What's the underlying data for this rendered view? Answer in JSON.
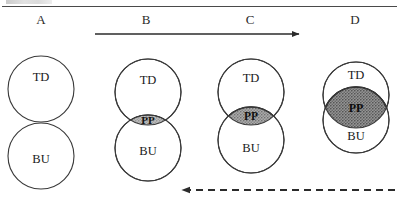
{
  "figure": {
    "panel_labels": [
      {
        "id": "A",
        "text": "A",
        "x": 41
      },
      {
        "id": "B",
        "text": "B",
        "x": 146
      },
      {
        "id": "C",
        "text": "C",
        "x": 250
      },
      {
        "id": "D",
        "text": "D",
        "x": 355
      }
    ],
    "top_arrow": {
      "name": "forward-progression-arrow",
      "style": "solid",
      "direction": "right",
      "x_start": 95,
      "x_end": 300,
      "y": 34
    },
    "bottom_arrow": {
      "name": "reverse-progression-arrow",
      "style": "dashed",
      "direction": "left",
      "x_start": 395,
      "x_end": 180,
      "y": 190
    },
    "circle_labels": {
      "top": "TD",
      "bottom": "BU",
      "overlap": "PP"
    },
    "panels": [
      {
        "id": "A",
        "cx": 41,
        "td_cy": 89,
        "bu_cy": 156,
        "r": 33,
        "td_label": "TD",
        "bu_label": "BU",
        "pp_label": "",
        "has_overlap": false,
        "overlap_fill": "",
        "td_label_y": 76,
        "bu_label_y": 163
      },
      {
        "id": "B",
        "cx": 148,
        "td_cy": 92,
        "bu_cy": 148,
        "r": 33,
        "td_label": "TD",
        "bu_label": "BU",
        "pp_label": "PP",
        "has_overlap": true,
        "overlap_fill": "#a8a8a8",
        "td_label_y": 80,
        "bu_label_y": 155
      },
      {
        "id": "C",
        "cx": 251,
        "td_cy": 92,
        "bu_cy": 140,
        "r": 33,
        "td_label": "TD",
        "bu_label": "BU",
        "pp_label": "PP",
        "has_overlap": true,
        "overlap_fill": "#9a9a9a",
        "td_label_y": 78,
        "bu_label_y": 151
      },
      {
        "id": "D",
        "cx": 356,
        "td_cy": 95,
        "bu_cy": 120,
        "r": 33,
        "td_label": "TD",
        "bu_label": "BU",
        "pp_label": "PP",
        "has_overlap": true,
        "overlap_fill": "#888888",
        "td_label_y": 79,
        "bu_label_y": 137
      }
    ],
    "colors": {
      "stroke": "#3a3a3a",
      "rule": "#4a4a4a",
      "text": "#1a1a1a",
      "circle_fill": "#ffffff"
    }
  }
}
